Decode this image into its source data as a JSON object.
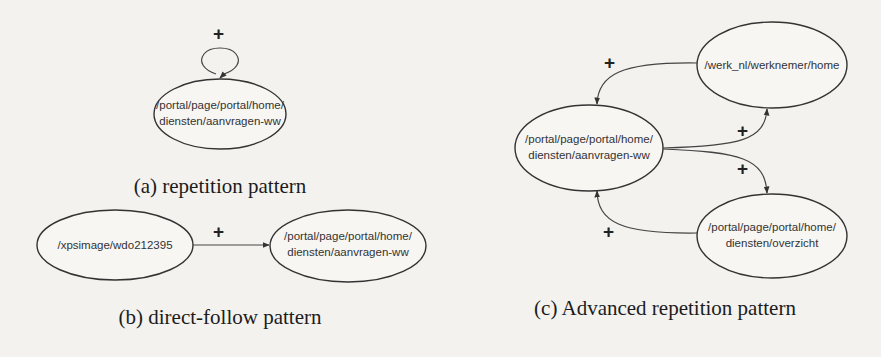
{
  "figure": {
    "panels": [
      {
        "id": "a",
        "caption": "(a) repetition pattern",
        "nodes": [
          {
            "line1": "/portal/page/portal/home/",
            "line2": "diensten/aanvragen-ww"
          }
        ],
        "edges": [
          {
            "from": 0,
            "to": 0,
            "label": "+",
            "type": "self-loop"
          }
        ]
      },
      {
        "id": "b",
        "caption": "(b) direct-follow pattern",
        "nodes": [
          {
            "line1": "/xpsimage/wdo212395",
            "line2": ""
          },
          {
            "line1": "/portal/page/portal/home/",
            "line2": "diensten/aanvragen-ww"
          }
        ],
        "edges": [
          {
            "from": 0,
            "to": 1,
            "label": "+"
          }
        ]
      },
      {
        "id": "c",
        "caption": "(c) Advanced repetition pattern",
        "nodes": [
          {
            "line1": "/werk_nl/werknemer/home",
            "line2": ""
          },
          {
            "line1": "/portal/page/portal/home/",
            "line2": "diensten/aanvragen-ww"
          },
          {
            "line1": "/portal/page/portal/home/",
            "line2": "diensten/overzicht"
          }
        ],
        "edges": [
          {
            "from": 0,
            "to": 1,
            "label": "+"
          },
          {
            "from": 1,
            "to": 0,
            "label": "+"
          },
          {
            "from": 1,
            "to": 2,
            "label": "+"
          },
          {
            "from": 2,
            "to": 1,
            "label": "+"
          }
        ]
      }
    ]
  }
}
